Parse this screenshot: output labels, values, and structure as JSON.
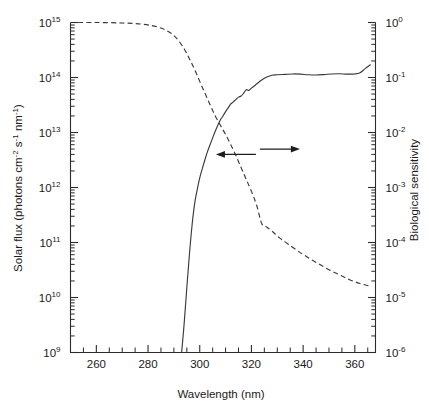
{
  "figure": {
    "background_color": "#ffffff",
    "line_color": "#3a3a3a"
  },
  "chart_data": {
    "type": "line",
    "title": "",
    "xlabel": "Wavelength (nm)",
    "ylabel": "Solar flux (photons cm-2 s-1 nm-1)",
    "ylabel_right": "Biological sensitivity",
    "xlim": [
      250,
      368
    ],
    "xscale": "linear",
    "yscale": "log",
    "ylim_left": [
      1000000000.0,
      1000000000000000.0
    ],
    "ylim_right": [
      1e-06,
      1.0
    ],
    "grid": false,
    "legend": "none",
    "annotations": [
      {
        "name": "left-pointing-arrow",
        "meaning": "solid curve refers to left axis",
        "direction": "left",
        "x_nm": 314,
        "y_left_flux": 4000000000000.0
      },
      {
        "name": "right-pointing-arrow",
        "meaning": "dashed curve refers to right axis",
        "direction": "right",
        "x_nm": 331,
        "y_right_sensitivity": 0.005
      }
    ],
    "xticks_major": [
      260,
      280,
      300,
      320,
      340,
      360
    ],
    "xtick_labels": [
      "260",
      "280",
      "300",
      "320",
      "340",
      "360"
    ],
    "xticks_minor_step": 5,
    "yticks_left_major": [
      1000000000.0,
      10000000000.0,
      100000000000.0,
      1000000000000.0,
      10000000000000.0,
      100000000000000.0,
      1000000000000000.0
    ],
    "ytick_left_labels": [
      "10^9",
      "10^10",
      "10^11",
      "10^12",
      "10^13",
      "10^14",
      "10^15"
    ],
    "yticks_right_major": [
      1e-06,
      1e-05,
      0.0001,
      0.001,
      0.01,
      0.1,
      1.0
    ],
    "ytick_right_labels": [
      "10^-6",
      "10^-5",
      "10^-4",
      "10^-3",
      "10^-2",
      "10^-1",
      "10^0"
    ],
    "series": [
      {
        "name": "Solar flux",
        "style": "solid",
        "axis": "left",
        "unit": "photons cm-2 s-1 nm-1",
        "x": [
          293.0,
          294.0,
          295.0,
          296.0,
          297.0,
          298.0,
          299.0,
          300.0,
          301.0,
          302.0,
          303.0,
          304.0,
          305.0,
          306.0,
          307.0,
          308.0,
          309.0,
          310.0,
          311.0,
          312.0,
          313.0,
          314.0,
          315.0,
          316.0,
          317.0,
          318.0,
          319.0,
          320.0,
          322.0,
          324.0,
          326.0,
          328.0,
          330.0,
          333.0,
          336.0,
          339.0,
          342.0,
          345.0,
          348.0,
          351.0,
          354.0,
          357.0,
          360.0,
          362.0,
          364.0,
          366.0
        ],
        "y": [
          1000000000.0,
          3500000000.0,
          15000000000.0,
          60000000000.0,
          200000000000.0,
          500000000000.0,
          900000000000.0,
          1500000000000.0,
          2200000000000.0,
          3200000000000.0,
          4500000000000.0,
          6000000000000.0,
          8000000000000.0,
          10500000000000.0,
          13500000000000.0,
          17000000000000.0,
          20000000000000.0,
          24000000000000.0,
          28000000000000.0,
          33000000000000.0,
          36000000000000.0,
          40000000000000.0,
          44000000000000.0,
          46000000000000.0,
          52000000000000.0,
          60000000000000.0,
          58000000000000.0,
          64000000000000.0,
          76000000000000.0,
          90000000000000.0,
          102000000000000.0,
          110000000000000.0,
          112000000000000.0,
          114000000000000.0,
          116000000000000.0,
          115000000000000.0,
          112000000000000.0,
          111000000000000.0,
          113000000000000.0,
          116000000000000.0,
          117000000000000.0,
          115000000000000.0,
          116000000000000.0,
          122000000000000.0,
          145000000000000.0,
          170000000000000.0
        ]
      },
      {
        "name": "Biological sensitivity",
        "style": "dashed",
        "axis": "right",
        "unit": "relative",
        "x": [
          253.0,
          260.0,
          270.0,
          278.0,
          284.0,
          288.0,
          291.0,
          294.0,
          296.0,
          298.0,
          300.0,
          302.0,
          304.0,
          306.0,
          308.0,
          310.0,
          312.0,
          314.0,
          316.0,
          318.0,
          320.0,
          322.0,
          324.0,
          326.0,
          328.0,
          331.0,
          334.0,
          338.0,
          342.0,
          346.0,
          350.0,
          354.0,
          358.0,
          362.0,
          366.0
        ],
        "y": [
          1.0,
          1.0,
          0.98,
          0.93,
          0.82,
          0.68,
          0.52,
          0.33,
          0.22,
          0.14,
          0.085,
          0.052,
          0.032,
          0.02,
          0.0135,
          0.0092,
          0.006,
          0.0038,
          0.0023,
          0.0014,
          0.00085,
          0.00048,
          0.00022,
          0.00019,
          0.00016,
          0.00012,
          9.5e-05,
          7e-05,
          5.3e-05,
          4.1e-05,
          3.2e-05,
          2.6e-05,
          2.1e-05,
          1.8e-05,
          1.6e-05
        ]
      }
    ]
  },
  "labels": {
    "x_axis_title": "Wavelength (nm)",
    "y_left_prefix": "Solar flux (photons cm",
    "y_left_exp1": "-2",
    "y_left_mid1": " s",
    "y_left_exp2": "-1",
    "y_left_mid2": " nm",
    "y_left_exp3": "-1",
    "y_left_suffix": ")",
    "y_right_title": "Biological sensitivity",
    "xticks": [
      "260",
      "280",
      "300",
      "320",
      "340",
      "360"
    ],
    "yticks_left_mantissa": "10",
    "yticks_left_exponents": [
      "15",
      "14",
      "13",
      "12",
      "11",
      "10",
      "9"
    ],
    "yticks_right_exponents": [
      "0",
      "-1",
      "-2",
      "-3",
      "-4",
      "-5",
      "-6"
    ]
  }
}
